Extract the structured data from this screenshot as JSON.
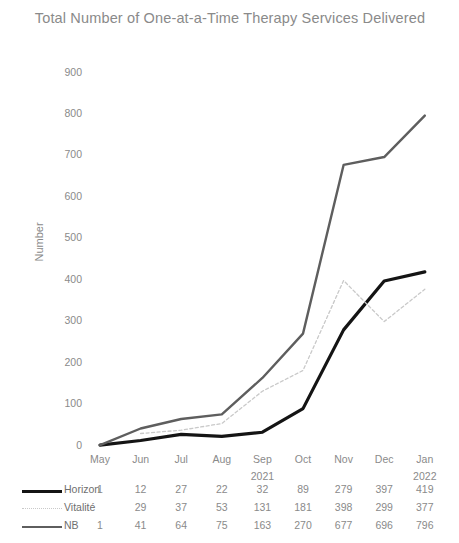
{
  "chart_data": {
    "type": "line",
    "title": "Total Number of One-at-a-Time Therapy Services Delivered",
    "xlabel": "",
    "ylabel": "Number",
    "categories": [
      "May",
      "Jun",
      "Jul",
      "Aug",
      "Sep",
      "Oct",
      "Nov",
      "Dec",
      "Jan"
    ],
    "year_groups": [
      {
        "label": "2021",
        "category_index": 4
      },
      {
        "label": "2022",
        "category_index": 8
      }
    ],
    "ylim": [
      0,
      900
    ],
    "yticks": [
      0,
      100,
      200,
      300,
      400,
      500,
      600,
      700,
      800,
      900
    ],
    "grid": false,
    "legend": "table-below",
    "series": [
      {
        "name": "Horizon",
        "values": [
          1,
          12,
          27,
          22,
          32,
          89,
          279,
          397,
          419
        ],
        "display_values": [
          "1",
          "12",
          "27",
          "22",
          "32",
          "89",
          "279",
          "397",
          "419"
        ],
        "color": "#141414",
        "style": "solid",
        "width": 3.2
      },
      {
        "name": "Vitalité",
        "values": [
          null,
          29,
          37,
          53,
          131,
          181,
          398,
          299,
          377
        ],
        "display_values": [
          "",
          "29",
          "37",
          "53",
          "131",
          "181",
          "398",
          "299",
          "377"
        ],
        "color": "#c9c9c9",
        "style": "dotted",
        "width": 1.3
      },
      {
        "name": "NB",
        "values": [
          1,
          41,
          64,
          75,
          163,
          270,
          677,
          696,
          796
        ],
        "display_values": [
          "1",
          "41",
          "64",
          "75",
          "163",
          "270",
          "677",
          "696",
          "796"
        ],
        "color": "#5e5e5e",
        "style": "solid",
        "width": 2.4
      }
    ]
  }
}
